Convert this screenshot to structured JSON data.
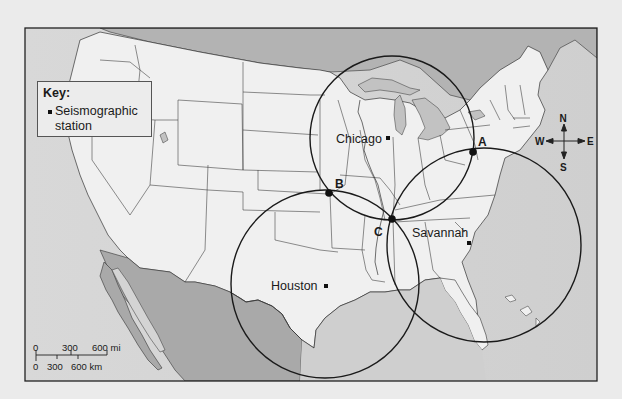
{
  "key": {
    "title": "Key:",
    "items": [
      {
        "symbol": "black-square",
        "label": "Seismographic station"
      }
    ]
  },
  "stations": [
    {
      "name": "Chicago",
      "x": 387,
      "y": 138,
      "label_x": 336,
      "label_y": 143,
      "circle_radius": 82,
      "circle_cx": 392,
      "circle_cy": 138
    },
    {
      "name": "Savannah",
      "x": 469,
      "y": 243,
      "label_x": 412,
      "label_y": 237,
      "circle_radius": 97,
      "circle_cx": 484,
      "circle_cy": 245
    },
    {
      "name": "Houston",
      "x": 326,
      "y": 286,
      "label_x": 271,
      "label_y": 290,
      "circle_radius": 94,
      "circle_cx": 325,
      "circle_cy": 284
    }
  ],
  "intersections": [
    {
      "label": "A",
      "x": 473,
      "y": 152
    },
    {
      "label": "B",
      "x": 329,
      "y": 193
    },
    {
      "label": "C",
      "x": 392,
      "y": 219
    }
  ],
  "compass": {
    "north": "N",
    "south": "S",
    "east": "E",
    "west": "W"
  },
  "scale_bar": {
    "miles": {
      "labels": [
        "0",
        "300",
        "600 mi"
      ]
    },
    "kilometers": {
      "labels": [
        "0",
        "300",
        "600 km"
      ]
    }
  },
  "colors": {
    "land_us": "#f0f0f0",
    "land_foreign": "#a9a9a9",
    "water": "#d4d4d4",
    "border": "#333333",
    "circle": "#1a1a1a",
    "page_bg": "#ebebeb"
  }
}
